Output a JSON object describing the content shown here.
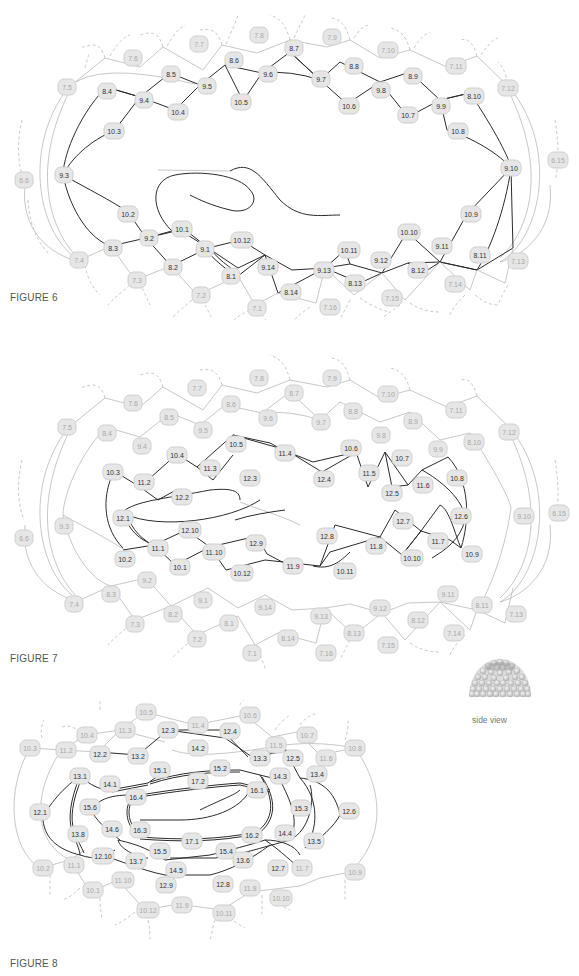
{
  "figures": [
    {
      "caption": "FIGURE 6",
      "dark_nodes": [
        "8.4",
        "8.5",
        "8.6",
        "8.7",
        "8.8",
        "8.9",
        "8.10",
        "9.3",
        "9.4",
        "9.5",
        "9.6",
        "9.7",
        "9.8",
        "9.9",
        "9.10",
        "10.2",
        "10.3",
        "10.4",
        "10.5",
        "10.6",
        "10.7",
        "10.8",
        "10.9",
        "10.1",
        "10.10",
        "10.11",
        "10.12",
        "9.1",
        "9.2",
        "9.11",
        "9.12",
        "9.13",
        "9.14",
        "8.1",
        "8.2",
        "8.3",
        "8.11",
        "8.12",
        "8.13",
        "8.14"
      ],
      "light_nodes": [
        "7.1",
        "7.2",
        "7.3",
        "7.4",
        "7.5",
        "7.6",
        "7.7",
        "7.8",
        "7.9",
        "7.10",
        "7.11",
        "7.12",
        "7.13",
        "7.14",
        "7.15",
        "7.16",
        "6.6",
        "6.15"
      ]
    },
    {
      "caption": "FIGURE 7",
      "dark_nodes": [
        "10.3",
        "10.4",
        "10.5",
        "10.6",
        "10.7",
        "10.8",
        "10.9",
        "10.1",
        "10.2",
        "10.10",
        "10.11",
        "10.12",
        "11.1",
        "11.2",
        "11.3",
        "11.4",
        "11.5",
        "11.6",
        "11.7",
        "11.8",
        "11.9",
        "11.10",
        "12.1",
        "12.2",
        "12.3",
        "12.4",
        "12.5",
        "12.6",
        "12.7",
        "12.8",
        "12.9",
        "12.10"
      ],
      "light_nodes": [
        "7.1",
        "7.2",
        "7.3",
        "7.4",
        "7.5",
        "7.6",
        "7.7",
        "7.8",
        "7.9",
        "7.10",
        "7.11",
        "7.12",
        "7.13",
        "7.14",
        "7.15",
        "7.16",
        "8.1",
        "8.2",
        "8.3",
        "8.4",
        "8.5",
        "8.6",
        "8.7",
        "8.8",
        "8.9",
        "8.10",
        "8.11",
        "8.12",
        "8.13",
        "8.14",
        "9.1",
        "9.2",
        "9.3",
        "9.4",
        "9.5",
        "9.6",
        "9.7",
        "9.8",
        "9.9",
        "9.10",
        "9.11",
        "9.12",
        "9.13",
        "9.14",
        "6.6",
        "6.15"
      ]
    },
    {
      "caption": "FIGURE 8",
      "dark_nodes": [
        "12.1",
        "12.2",
        "12.3",
        "12.4",
        "12.5",
        "12.6",
        "12.7",
        "12.8",
        "12.9",
        "12.10",
        "13.1",
        "13.2",
        "13.3",
        "13.4",
        "13.5",
        "13.6",
        "13.7",
        "13.8",
        "14.1",
        "14.2",
        "14.3",
        "14.4",
        "14.5",
        "14.6",
        "15.1",
        "15.2",
        "15.3",
        "15.4",
        "15.5",
        "15.6",
        "16.1",
        "16.2",
        "16.3",
        "16.4",
        "17.1",
        "17.2"
      ],
      "light_nodes": [
        "10.1",
        "10.2",
        "10.3",
        "10.4",
        "10.5",
        "10.6",
        "10.7",
        "10.8",
        "10.9",
        "10.10",
        "10.11",
        "10.12",
        "11.1",
        "11.2",
        "11.3",
        "11.4",
        "11.5",
        "11.6",
        "11.7",
        "11.8",
        "11.9",
        "11.10"
      ]
    }
  ],
  "side_view": {
    "label": "side view"
  },
  "colors": {
    "node_fill": "#e6e6e6",
    "dark_edge": "#2b2b2b",
    "light_edge": "#b9b9b9",
    "dark_text": "#333333",
    "light_text": "#a8a8a8"
  }
}
